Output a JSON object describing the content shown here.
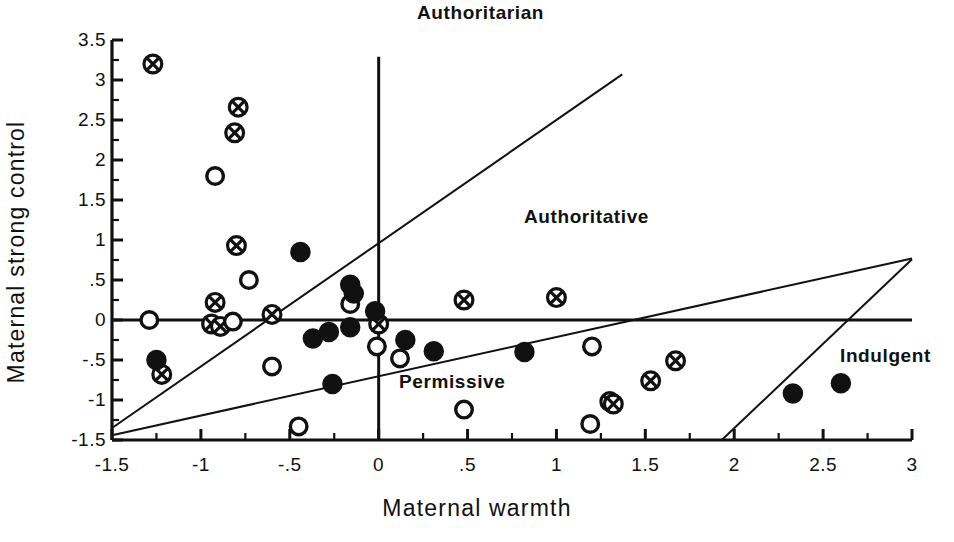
{
  "figure": {
    "background_color": "#ffffff",
    "ink_color": "#111111"
  },
  "axes": {
    "x_title": "Maternal warmth",
    "y_title": "Maternal strong control",
    "x_ticks": [
      "-1.5",
      "-1",
      "-.5",
      "0",
      ".5",
      "1",
      "1.5",
      "2",
      "2.5",
      "3"
    ],
    "x_tick_values": [
      -1.5,
      -1,
      -0.5,
      0,
      0.5,
      1,
      1.5,
      2,
      2.5,
      3
    ],
    "y_ticks": [
      "3.5",
      "3",
      "2.5",
      "2",
      "1.5",
      "1",
      ".5",
      "0",
      "-.5",
      "-1",
      "-1.5"
    ],
    "y_tick_values": [
      3.5,
      3,
      2.5,
      2,
      1.5,
      1,
      0.5,
      0,
      -0.5,
      -1,
      -1.5
    ],
    "x_minor_step": 0.25,
    "y_minor_step": 0.25,
    "xlim": [
      -1.5,
      3
    ],
    "ylim": [
      -1.5,
      3.5
    ],
    "grid": false
  },
  "annotations": [
    {
      "id": "authoritarian",
      "text": "Authoritarian",
      "x": 0.22,
      "y": 3.55
    },
    {
      "id": "authoritative",
      "text": "Authoritative",
      "x": 0.85,
      "y": 0.99
    },
    {
      "id": "permissive",
      "text": "Permissive",
      "x": 0.14,
      "y": -0.88
    },
    {
      "id": "indulgent",
      "text": "Indulgent",
      "x": 2.62,
      "y": -0.68
    }
  ],
  "chart_data": {
    "type": "scatter",
    "title": "",
    "xlabel": "Maternal warmth",
    "ylabel": "Maternal strong control",
    "xlim": [
      -1.5,
      3
    ],
    "ylim": [
      -1.5,
      3.5
    ],
    "grid": false,
    "legend_position": "none",
    "reference_lines": [
      {
        "name": "vertical-divider",
        "style": "solid",
        "x1": 0.0,
        "y1": 3.29,
        "x2": 0.0,
        "y2": -1.5
      },
      {
        "name": "horizontal-divider",
        "style": "solid",
        "x1": -1.5,
        "y1": 0.0,
        "x2": 3.0,
        "y2": 0.0
      },
      {
        "name": "steep-diagonal",
        "style": "solid",
        "x1": -1.5,
        "y1": -1.35,
        "x2": 1.37,
        "y2": 3.07
      },
      {
        "name": "shallow-diagonal",
        "style": "solid",
        "x1": -1.5,
        "y1": -1.44,
        "x2": 3.0,
        "y2": 0.77
      },
      {
        "name": "indulgent-boundary",
        "style": "solid",
        "x1": 1.93,
        "y1": -1.5,
        "x2": 3.0,
        "y2": 0.76
      }
    ],
    "series": [
      {
        "name": "crossed-circle",
        "marker": "circle-with-cross",
        "fill": "#ffffff",
        "edge": "#111111",
        "points": [
          [
            -1.27,
            3.2
          ],
          [
            -0.79,
            2.66
          ],
          [
            -0.81,
            2.34
          ],
          [
            -0.8,
            0.93
          ],
          [
            -0.92,
            0.22
          ],
          [
            -0.94,
            -0.05
          ],
          [
            -0.89,
            -0.08
          ],
          [
            -0.6,
            0.07
          ],
          [
            -1.22,
            -0.68
          ],
          [
            0.0,
            -0.05
          ],
          [
            0.48,
            0.25
          ],
          [
            1.0,
            0.28
          ],
          [
            1.67,
            -0.51
          ],
          [
            1.53,
            -0.76
          ],
          [
            1.3,
            -1.02
          ],
          [
            1.32,
            -1.05
          ]
        ]
      },
      {
        "name": "open-circle",
        "marker": "circle-open",
        "fill": "#ffffff",
        "edge": "#111111",
        "points": [
          [
            -0.92,
            1.8
          ],
          [
            -0.73,
            0.5
          ],
          [
            -1.29,
            0.0
          ],
          [
            -0.82,
            -0.02
          ],
          [
            -0.16,
            0.2
          ],
          [
            -0.6,
            -0.58
          ],
          [
            -0.01,
            -0.33
          ],
          [
            0.12,
            -0.48
          ],
          [
            -0.45,
            -1.33
          ],
          [
            0.48,
            -1.12
          ],
          [
            1.2,
            -0.33
          ],
          [
            1.19,
            -1.3
          ]
        ]
      },
      {
        "name": "filled-circle",
        "marker": "circle-filled",
        "fill": "#111111",
        "edge": "#111111",
        "points": [
          [
            -0.44,
            0.85
          ],
          [
            -0.16,
            0.44
          ],
          [
            -0.14,
            0.33
          ],
          [
            -0.02,
            0.11
          ],
          [
            -1.25,
            -0.5
          ],
          [
            -0.37,
            -0.23
          ],
          [
            -0.28,
            -0.15
          ],
          [
            -0.16,
            -0.09
          ],
          [
            0.15,
            -0.25
          ],
          [
            0.31,
            -0.39
          ],
          [
            0.82,
            -0.4
          ],
          [
            -0.26,
            -0.8
          ],
          [
            2.33,
            -0.92
          ],
          [
            2.6,
            -0.79
          ]
        ]
      }
    ]
  }
}
